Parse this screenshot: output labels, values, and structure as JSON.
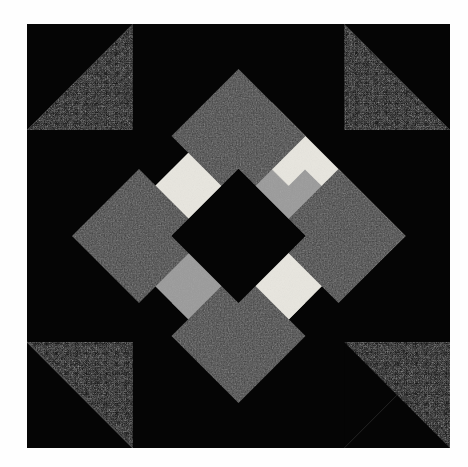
{
  "image": {
    "kind": "quilt-block-photograph",
    "title": "Pieced quilt block",
    "width": 468,
    "height": 467,
    "background_color": "#fefefe",
    "margin": {
      "left": 27,
      "top": 24,
      "right": 18,
      "bottom": 19
    }
  },
  "palette": {
    "background": "#fefefe",
    "black": "#050505",
    "charcoal_texture": "#171717",
    "dark_gray": "#3a3a3a",
    "medium_gray": "#9a9a9a",
    "light_gray": "#b0b0b0",
    "cream": "#e8e6df",
    "seam_line": "#6d6d6d"
  },
  "block": {
    "name": "diamond-in-a-square-with-sashed-ring",
    "grid": "4x4 units",
    "unit_size": 105.75,
    "size": 423,
    "center_field": {
      "name": "center-square-on-point",
      "color": "#050505"
    },
    "corners": [
      {
        "name": "corner-unit-top-left",
        "position": "top-left",
        "type": "half-square-triangle",
        "outer_color": "#050505",
        "inner_color": "#191919",
        "triangle_orientation": "lower-right"
      },
      {
        "name": "corner-unit-top-right",
        "position": "top-right",
        "type": "half-square-triangle",
        "outer_color": "#050505",
        "inner_color": "#191919",
        "triangle_orientation": "lower-left"
      },
      {
        "name": "corner-unit-bottom-left",
        "position": "bottom-left",
        "type": "half-square-triangle",
        "outer_color": "#050505",
        "inner_color": "#191919",
        "triangle_orientation": "upper-right"
      },
      {
        "name": "corner-unit-bottom-right",
        "position": "bottom-right",
        "type": "half-square-triangle",
        "outer_color": "#050505",
        "inner_color": "#191919",
        "triangle_orientation": "upper-left"
      }
    ],
    "midpoint_squares": [
      {
        "name": "midpoint-square-top",
        "position": "top-center",
        "color": "#3a3a3a",
        "rotation_deg": 45
      },
      {
        "name": "midpoint-square-left",
        "position": "middle-left",
        "color": "#3a3a3a",
        "rotation_deg": 45
      },
      {
        "name": "midpoint-square-right",
        "position": "middle-right",
        "color": "#3a3a3a",
        "rotation_deg": 45
      },
      {
        "name": "midpoint-square-bottom",
        "position": "bottom-center",
        "color": "#3a3a3a",
        "rotation_deg": 45
      }
    ],
    "sashing_bars": [
      {
        "name": "sash-bar-upper-left",
        "quadrant": "upper-left",
        "angle_deg": 45,
        "stripes": [
          {
            "name": "stripe-cream",
            "color": "#e8e6df",
            "position": "outer"
          },
          {
            "name": "stripe-gray",
            "color": "#9a9a9a",
            "position": "inner"
          }
        ]
      },
      {
        "name": "sash-bar-upper-right",
        "quadrant": "upper-right",
        "angle_deg": -45,
        "stripes": [
          {
            "name": "stripe-gray",
            "color": "#9a9a9a",
            "position": "inner"
          },
          {
            "name": "stripe-cream",
            "color": "#e8e6df",
            "position": "outer"
          }
        ]
      },
      {
        "name": "sash-bar-lower-left",
        "quadrant": "lower-left",
        "angle_deg": -45,
        "stripes": [
          {
            "name": "stripe-gray",
            "color": "#9a9a9a",
            "position": "outer"
          },
          {
            "name": "stripe-cream",
            "color": "#e8e6df",
            "position": "inner"
          }
        ]
      },
      {
        "name": "sash-bar-lower-right",
        "quadrant": "lower-right",
        "angle_deg": 45,
        "stripes": [
          {
            "name": "stripe-cream",
            "color": "#e8e6df",
            "position": "inner"
          },
          {
            "name": "stripe-gray",
            "color": "#9a9a9a",
            "position": "outer"
          }
        ]
      }
    ]
  }
}
